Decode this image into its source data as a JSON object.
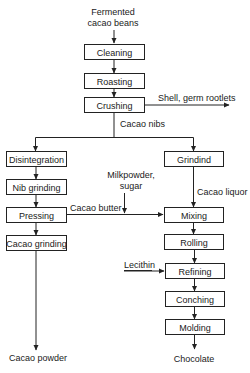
{
  "diagram": {
    "type": "process-flowchart",
    "input": {
      "line1": "Fermented",
      "line2": "cacao beans"
    },
    "trunk_steps": [
      "Cleaning",
      "Roasting",
      "Crushing"
    ],
    "crushing_byproduct": "Shell, germ rootlets",
    "trunk_output": "Cacao nibs",
    "left_branch": {
      "steps": [
        "Disintegration",
        "Nib grinding",
        "Pressing",
        "Cacao grinding"
      ],
      "side_output_label": "Cacao butter",
      "final_product": "Cacao powder"
    },
    "right_branch": {
      "steps": [
        "Grindind",
        "Mixing",
        "Rolling",
        "Refining",
        "Conching",
        "Molding"
      ],
      "intermediate_label": "Cacao liquor",
      "added_ingredients": {
        "line1": "Milkpowder,",
        "line2": "sugar"
      },
      "additive": "Lecithin",
      "final_product": "Chocolate"
    }
  }
}
